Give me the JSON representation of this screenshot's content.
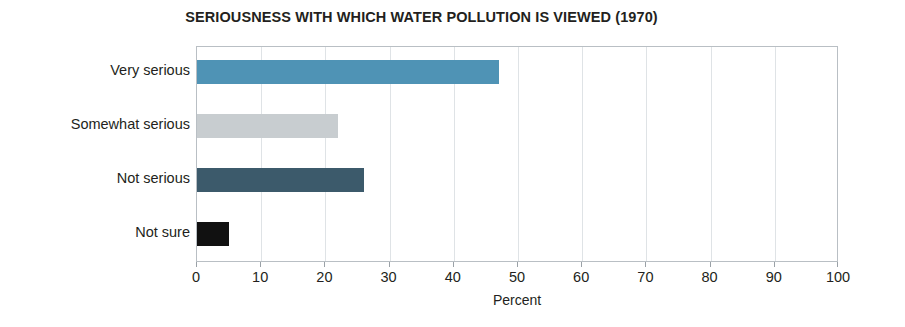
{
  "chart_data": {
    "type": "bar",
    "orientation": "horizontal",
    "title": "SERIOUSNESS WITH WHICH WATER POLLUTION IS VIEWED (1970)",
    "xlabel": "Percent",
    "ylabel": "",
    "xlim": [
      0,
      100
    ],
    "xticks": [
      "0",
      "10",
      "20",
      "30",
      "40",
      "50",
      "60",
      "70",
      "80",
      "90",
      "100"
    ],
    "grid": "vertical",
    "legend": "none",
    "categories": [
      "Very serious",
      "Somewhat serious",
      "Not serious",
      "Not sure"
    ],
    "values": [
      47,
      22,
      26,
      5
    ],
    "bar_colors": [
      "#4f93b5",
      "#c8cdd0",
      "#3c5a6b",
      "#111111"
    ],
    "series": [
      {
        "name": "Percent",
        "points": [
          {
            "category": "Very serious",
            "value": 47,
            "color": "#4f93b5"
          },
          {
            "category": "Somewhat serious",
            "value": 22,
            "color": "#c8cdd0"
          },
          {
            "category": "Not serious",
            "value": 26,
            "color": "#3c5a6b"
          },
          {
            "category": "Not sure",
            "value": 5,
            "color": "#111111"
          }
        ]
      }
    ],
    "axis_color": "#b9bfc4",
    "gridline_color": "#dfe3e6",
    "text_color": "#231f20",
    "background": "#ffffff"
  }
}
